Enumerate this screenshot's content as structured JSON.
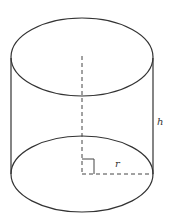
{
  "diagram": {
    "type": "cylinder",
    "labels": {
      "height": "h",
      "radius": "r"
    },
    "colors": {
      "stroke": "#333333",
      "dashed": "#444444",
      "background": "#ffffff"
    }
  }
}
